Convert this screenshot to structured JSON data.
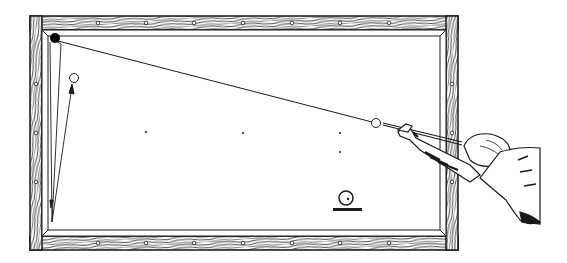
{
  "figure": {
    "colors": {
      "ink": "#1a1a1a",
      "paper": "#ffffff"
    },
    "table": {
      "outer": [
        30,
        16,
        458,
        250
      ],
      "inner": [
        48,
        30,
        440,
        236
      ],
      "rail_diamonds_top": 7,
      "rail_diamonds_bottom": 7,
      "rail_diamonds_side": 3
    },
    "balls": [
      {
        "id": "black-ball",
        "cx": 55,
        "cy": 38,
        "r": 5,
        "fill": "#000000"
      },
      {
        "id": "object-ball",
        "cx": 74,
        "cy": 78,
        "r": 4.5,
        "fill": "#ffffff"
      },
      {
        "id": "cue-ball",
        "cx": 376,
        "cy": 123,
        "r": 4.5,
        "fill": "#ffffff"
      }
    ],
    "spots": [
      [
        146,
        132
      ],
      [
        243,
        133
      ],
      [
        340,
        133
      ],
      [
        340,
        152
      ]
    ],
    "shot_path": [
      [
        55,
        38
      ],
      [
        376,
        123
      ]
    ],
    "rebound_path": [
      [
        52,
        222
      ],
      [
        54,
        40
      ],
      [
        62,
        45
      ],
      [
        52,
        222
      ]
    ],
    "arrow_to_object": [
      [
        52,
        222
      ],
      [
        72,
        83
      ]
    ],
    "ball_on_stand": {
      "cx": 346,
      "cy": 198,
      "r": 7,
      "base": [
        333,
        208,
        362,
        211
      ]
    },
    "player": "Player leaning over rail from right, cue aimed at cue ball"
  }
}
